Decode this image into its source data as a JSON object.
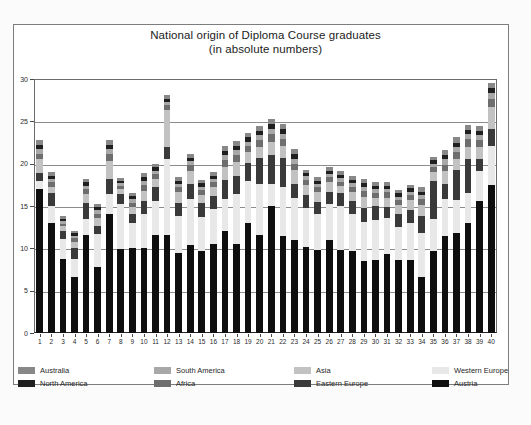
{
  "chart_data": {
    "type": "bar",
    "subtype": "stacked-bar",
    "title": "National origin of Diploma Course graduates",
    "subtitle": "(in absolute numbers)",
    "xlabel": "",
    "ylabel": "",
    "ylim": [
      0,
      30
    ],
    "yticks": [
      0,
      5,
      10,
      15,
      20,
      25,
      30
    ],
    "grid": true,
    "legend_position": "bottom",
    "categories": [
      "1",
      "2",
      "3",
      "4",
      "5",
      "6",
      "7",
      "8",
      "9",
      "10",
      "11",
      "12",
      "13",
      "14",
      "15",
      "16",
      "17",
      "18",
      "19",
      "20",
      "21",
      "22",
      "23",
      "24",
      "25",
      "26",
      "27",
      "28",
      "29",
      "30",
      "31",
      "32",
      "33",
      "34",
      "35",
      "36",
      "37",
      "38",
      "39",
      "40"
    ],
    "series": [
      {
        "name": "Austria",
        "color": "#100f0f",
        "values": [
          17.0,
          13.0,
          8.8,
          6.6,
          11.6,
          7.8,
          14.0,
          9.9,
          10.0,
          10.1,
          11.6,
          11.6,
          9.5,
          10.4,
          9.7,
          10.5,
          12.0,
          10.5,
          13.0,
          11.6,
          15.0,
          11.5,
          11.0,
          10.2,
          9.8,
          11.0,
          9.8,
          9.7,
          8.5,
          8.6,
          9.3,
          8.6,
          8.6,
          6.6,
          9.7,
          11.5,
          11.8,
          13.0,
          15.6,
          17.5
        ]
      },
      {
        "name": "Western Europe",
        "color": "#e8e8e8",
        "values": [
          0.9,
          2.0,
          2.3,
          2.2,
          1.9,
          3.9,
          2.4,
          5.3,
          3.0,
          4.0,
          4.0,
          9.0,
          4.3,
          5.4,
          4.0,
          4.2,
          3.8,
          5.9,
          5.0,
          6.0,
          2.6,
          5.8,
          5.0,
          4.6,
          4.3,
          4.2,
          5.2,
          4.3,
          4.6,
          4.8,
          4.3,
          3.9,
          4.4,
          5.2,
          3.8,
          4.3,
          3.9,
          3.5,
          3.5,
          4.6
        ]
      },
      {
        "name": "Eastern Europe",
        "color": "#3a3a3a",
        "values": [
          1.0,
          1.5,
          0.9,
          1.3,
          1.8,
          1.0,
          1.8,
          1.2,
          1.1,
          1.5,
          1.6,
          1.4,
          1.6,
          1.8,
          1.6,
          1.5,
          2.3,
          2.1,
          2.1,
          3.1,
          3.4,
          3.4,
          1.6,
          1.5,
          1.4,
          1.5,
          1.5,
          1.6,
          1.7,
          1.6,
          1.3,
          1.6,
          1.5,
          2.0,
          4.5,
          1.8,
          3.5,
          4.0,
          1.4,
          2.0
        ]
      },
      {
        "name": "Asia",
        "color": "#c2c2c2",
        "values": [
          1.6,
          0.8,
          0.6,
          0.7,
          1.1,
          0.9,
          2.1,
          0.6,
          0.8,
          1.2,
          1.0,
          4.3,
          1.2,
          1.5,
          1.0,
          1.0,
          1.5,
          1.7,
          1.3,
          1.3,
          1.6,
          1.4,
          1.6,
          1.2,
          1.1,
          1.1,
          0.9,
          1.1,
          1.3,
          1.0,
          1.1,
          1.0,
          1.2,
          1.3,
          1.0,
          1.5,
          1.4,
          1.5,
          1.5,
          2.6
        ]
      },
      {
        "name": "Africa",
        "color": "#6e6e6e",
        "values": [
          0.7,
          0.5,
          0.3,
          0.4,
          0.6,
          0.5,
          0.8,
          0.4,
          0.5,
          0.7,
          0.6,
          0.6,
          0.6,
          0.7,
          0.6,
          0.6,
          0.8,
          0.8,
          0.7,
          0.8,
          0.9,
          0.8,
          0.8,
          0.6,
          0.6,
          0.6,
          0.5,
          0.6,
          0.7,
          0.6,
          0.6,
          0.6,
          0.6,
          0.7,
          0.6,
          0.8,
          0.8,
          0.9,
          0.8,
          1.0
        ]
      },
      {
        "name": "South America",
        "color": "#a8a8a8",
        "values": [
          0.5,
          0.4,
          0.3,
          0.3,
          0.4,
          0.4,
          0.6,
          0.3,
          0.4,
          0.5,
          0.4,
          0.4,
          0.4,
          0.5,
          0.4,
          0.4,
          0.6,
          0.6,
          0.5,
          0.6,
          0.6,
          0.6,
          0.6,
          0.4,
          0.4,
          0.4,
          0.4,
          0.4,
          0.5,
          0.4,
          0.4,
          0.4,
          0.4,
          0.5,
          0.4,
          0.6,
          0.6,
          0.6,
          0.6,
          0.6
        ]
      },
      {
        "name": "North America",
        "color": "#1f1f1f",
        "values": [
          0.5,
          0.4,
          0.3,
          0.3,
          0.4,
          0.4,
          0.5,
          0.3,
          0.4,
          0.4,
          0.4,
          0.4,
          0.4,
          0.4,
          0.4,
          0.4,
          0.5,
          0.5,
          0.5,
          0.5,
          0.6,
          0.6,
          0.5,
          0.4,
          0.4,
          0.4,
          0.4,
          0.4,
          0.4,
          0.4,
          0.4,
          0.4,
          0.4,
          0.4,
          0.4,
          0.5,
          0.5,
          0.5,
          0.5,
          0.6
        ]
      },
      {
        "name": "Australia",
        "color": "#888888",
        "values": [
          0.6,
          0.4,
          0.3,
          0.3,
          0.4,
          0.4,
          0.6,
          0.3,
          0.4,
          0.5,
          0.4,
          0.4,
          0.4,
          0.5,
          0.4,
          0.4,
          0.6,
          0.6,
          0.5,
          0.6,
          0.6,
          0.6,
          0.6,
          0.4,
          0.4,
          0.4,
          0.4,
          0.4,
          0.5,
          0.4,
          0.4,
          0.4,
          0.4,
          0.5,
          0.4,
          0.6,
          0.6,
          0.6,
          0.6,
          0.6
        ]
      }
    ],
    "totals": [
      21.8,
      19.0,
      13.8,
      12.1,
      18.2,
      15.3,
      22.8,
      18.3,
      16.6,
      18.9,
      20.0,
      27.5,
      18.4,
      21.2,
      18.1,
      19.0,
      22.1,
      22.7,
      23.6,
      24.5,
      25.3,
      24.7,
      21.7,
      19.3,
      18.4,
      19.6,
      19.1,
      18.5,
      18.2,
      17.8,
      17.8,
      16.9,
      17.5,
      17.2,
      20.8,
      21.6,
      23.1,
      24.6,
      24.5,
      29.5
    ]
  },
  "legend": {
    "items": [
      {
        "label": "Australia",
        "color": "#888888"
      },
      {
        "label": "North America",
        "color": "#1f1f1f"
      },
      {
        "label": "South America",
        "color": "#a8a8a8"
      },
      {
        "label": "Africa",
        "color": "#6e6e6e"
      },
      {
        "label": "Asia",
        "color": "#c2c2c2"
      },
      {
        "label": "Eastern Europe",
        "color": "#3a3a3a"
      },
      {
        "label": "Western Europe",
        "color": "#e8e8e8"
      },
      {
        "label": "Austria",
        "color": "#100f0f"
      }
    ]
  }
}
